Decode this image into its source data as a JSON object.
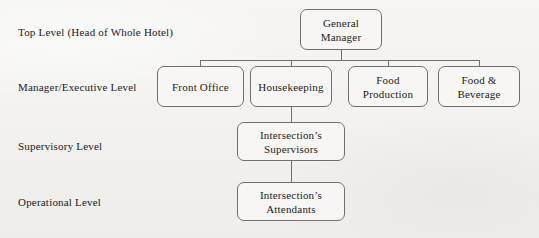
{
  "diagram": {
    "type": "org-chart",
    "background_color": "#f4f3f1",
    "line_color": "#6f6f6f",
    "text_color": "#1b1b1b",
    "levels": [
      {
        "id": "top",
        "label": "Top Level (Head of Whole Hotel)"
      },
      {
        "id": "manager",
        "label": "Manager/Executive Level"
      },
      {
        "id": "supervisory",
        "label": "Supervisory Level"
      },
      {
        "id": "operational",
        "label": "Operational Level"
      }
    ],
    "nodes": [
      {
        "id": "general-manager",
        "label": "General\nManager",
        "level": "top"
      },
      {
        "id": "front-office",
        "label": "Front Office",
        "level": "manager"
      },
      {
        "id": "housekeeping",
        "label": "Housekeeping",
        "level": "manager"
      },
      {
        "id": "food-production",
        "label": "Food\nProduction",
        "level": "manager"
      },
      {
        "id": "food-beverage",
        "label": "Food &\nBeverage",
        "level": "manager"
      },
      {
        "id": "supervisors",
        "label": "Intersection’s\nSupervisors",
        "level": "supervisory"
      },
      {
        "id": "attendants",
        "label": "Intersection’s\nAttendants",
        "level": "operational"
      }
    ],
    "edges": [
      {
        "from": "general-manager",
        "to": "front-office"
      },
      {
        "from": "general-manager",
        "to": "housekeeping"
      },
      {
        "from": "general-manager",
        "to": "food-production"
      },
      {
        "from": "general-manager",
        "to": "food-beverage"
      },
      {
        "from": "housekeeping",
        "to": "supervisors"
      },
      {
        "from": "supervisors",
        "to": "attendants"
      }
    ]
  }
}
